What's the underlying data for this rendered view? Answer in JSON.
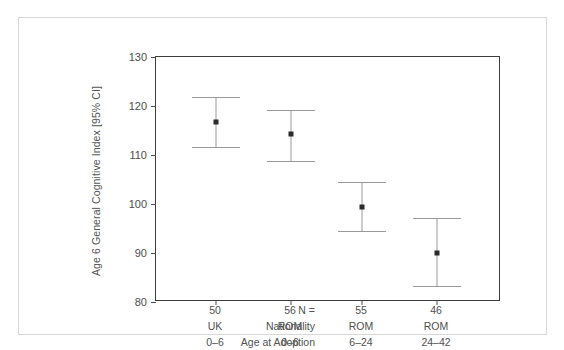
{
  "chart_data": {
    "type": "scatter",
    "title": "",
    "subtitle": "",
    "xlabel": "",
    "ylabel": "Age 6 General Cognitive Index [95% CI]",
    "ylim": [
      80,
      130
    ],
    "yticks": [
      80,
      90,
      100,
      110,
      120,
      130
    ],
    "ytick_labels": [
      "80",
      "90",
      "100",
      "110",
      "120",
      "130"
    ],
    "grid": false,
    "legend": "none",
    "error_bar_type": "95% CI",
    "categories": [
      "50 / UK / 0–6",
      "56 / ROM / 0–6",
      "55 / ROM / 6–24",
      "46 / ROM / 24–42"
    ],
    "x": [
      1,
      2,
      3,
      4
    ],
    "values": [
      116.8,
      114.3,
      99.3,
      90.1
    ],
    "ci_lower": [
      111.6,
      108.8,
      94.4,
      83.2
    ],
    "ci_upper": [
      121.8,
      119.2,
      104.4,
      97.2
    ],
    "series": [
      {
        "name": "Age 6 General Cognitive Index",
        "points": [
          {
            "category": "50 / UK / 0–6",
            "mean": 116.8,
            "lower": 111.6,
            "upper": 121.8,
            "n": 50
          },
          {
            "category": "56 / ROM / 0–6",
            "mean": 114.3,
            "lower": 108.8,
            "upper": 119.2,
            "n": 56
          },
          {
            "category": "55 / ROM / 6–24",
            "mean": 99.3,
            "lower": 94.4,
            "upper": 104.4,
            "n": 55
          },
          {
            "category": "46 / ROM / 24–42",
            "mean": 90.1,
            "lower": 83.2,
            "upper": 97.2,
            "n": 46
          }
        ]
      }
    ]
  },
  "axis": {
    "y_title": "Age 6 General Cognitive Index [95% CI]",
    "y_ticks": [
      "130",
      "120",
      "110",
      "100",
      "90",
      "80"
    ]
  },
  "bottom_table": {
    "row_headers": [
      "N =",
      "Nationality",
      "Age at Adoption"
    ],
    "columns": [
      {
        "n": "50",
        "nationality": "UK",
        "age_at_adoption": "0–6"
      },
      {
        "n": "56",
        "nationality": "ROM",
        "age_at_adoption": "0–6"
      },
      {
        "n": "55",
        "nationality": "ROM",
        "age_at_adoption": "6–24"
      },
      {
        "n": "46",
        "nationality": "ROM",
        "age_at_adoption": "24–42"
      }
    ]
  },
  "colors": {
    "marker": "#2b2b2b",
    "errorbar": "#9a9a9a",
    "axis": "#3c3c3c",
    "text": "#505050",
    "outer_frame": "#d7d7d7",
    "background": "#ffffff"
  }
}
